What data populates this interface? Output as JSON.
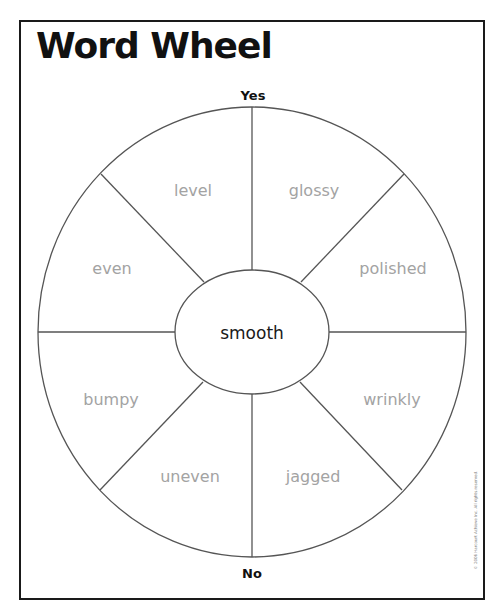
{
  "title": "Word Wheel",
  "poles": {
    "top": "Yes",
    "bottom": "No"
  },
  "center_word": "smooth",
  "words": [
    {
      "id": "level",
      "label": "level",
      "x": 193,
      "y": 190
    },
    {
      "id": "glossy",
      "label": "glossy",
      "x": 314,
      "y": 190
    },
    {
      "id": "even",
      "label": "even",
      "x": 112,
      "y": 268
    },
    {
      "id": "polished",
      "label": "polished",
      "x": 393,
      "y": 268
    },
    {
      "id": "bumpy",
      "label": "bumpy",
      "x": 111,
      "y": 399
    },
    {
      "id": "wrinkly",
      "label": "wrinkly",
      "x": 392,
      "y": 399
    },
    {
      "id": "uneven",
      "label": "uneven",
      "x": 190,
      "y": 476
    },
    {
      "id": "jagged",
      "label": "jagged",
      "x": 313,
      "y": 476
    }
  ],
  "copyright": "© 2006 Harcourt Achieve Inc. All rights reserved.",
  "colors": {
    "lines": "#555555",
    "word_text": "#a3a3a3",
    "center_text": "#1a1a1a",
    "frame": "#1a1a1a"
  }
}
